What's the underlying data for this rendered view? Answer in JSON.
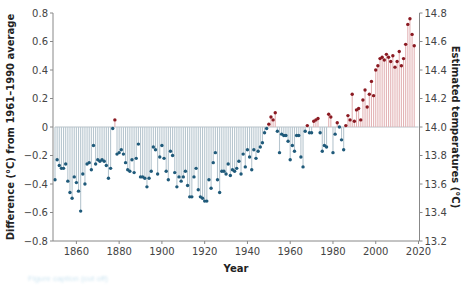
{
  "chart_data": {
    "type": "bar",
    "subtype": "lollipop",
    "title": "",
    "xlabel": "Year",
    "ylabel": "Difference (°C) from 1961–1990 average",
    "ylabel_right": "Estimated temperatures (°C)",
    "xlim": [
      1850,
      2020
    ],
    "ylim": [
      -0.8,
      0.8
    ],
    "ylim_right": [
      13.2,
      14.8
    ],
    "x_ticks": [
      1860,
      1880,
      1900,
      1920,
      1940,
      1960,
      1980,
      2000,
      2020
    ],
    "y_ticks": [
      -0.8,
      -0.6,
      -0.4,
      -0.2,
      0,
      0.2,
      0.4,
      0.6,
      0.8
    ],
    "y_ticks_right": [
      13.2,
      13.4,
      13.6,
      13.8,
      14.0,
      14.2,
      14.4,
      14.6,
      14.8
    ],
    "y_tick_labels": [
      "−0.8",
      "−0.6",
      "−0.4",
      "−0.2",
      "0",
      "0.2",
      "0.4",
      "0.6",
      "0.8"
    ],
    "y_tick_labels_right": [
      "13.2",
      "13.4",
      "13.6",
      "13.8",
      "14.0",
      "14.2",
      "14.4",
      "14.6",
      "14.8"
    ],
    "grid": false,
    "legend": null,
    "colors": {
      "negative_point": "#1f5a7a",
      "negative_bar": "#b7c6cf",
      "positive_point": "#8b1a22",
      "positive_bar": "#e3b4b6",
      "axis": "#888888"
    },
    "x_start": 1850,
    "values": [
      -0.37,
      -0.23,
      -0.27,
      -0.29,
      -0.29,
      -0.26,
      -0.38,
      -0.46,
      -0.5,
      -0.35,
      -0.39,
      -0.45,
      -0.59,
      -0.33,
      -0.4,
      -0.26,
      -0.25,
      -0.3,
      -0.13,
      -0.26,
      -0.23,
      -0.24,
      -0.23,
      -0.24,
      -0.27,
      -0.36,
      -0.29,
      -0.01,
      0.05,
      -0.19,
      -0.18,
      -0.16,
      -0.19,
      -0.25,
      -0.3,
      -0.31,
      -0.23,
      -0.32,
      -0.22,
      -0.12,
      -0.35,
      -0.35,
      -0.36,
      -0.42,
      -0.36,
      -0.31,
      -0.14,
      -0.16,
      -0.33,
      -0.21,
      -0.13,
      -0.22,
      -0.31,
      -0.37,
      -0.17,
      -0.2,
      -0.32,
      -0.42,
      -0.35,
      -0.38,
      -0.35,
      -0.31,
      -0.41,
      -0.49,
      -0.49,
      -0.35,
      -0.29,
      -0.44,
      -0.49,
      -0.5,
      -0.52,
      -0.52,
      -0.37,
      -0.43,
      -0.25,
      -0.18,
      -0.37,
      -0.46,
      -0.31,
      -0.31,
      -0.33,
      -0.26,
      -0.34,
      -0.3,
      -0.31,
      -0.29,
      -0.24,
      -0.33,
      -0.19,
      -0.28,
      -0.16,
      -0.21,
      -0.3,
      -0.16,
      -0.22,
      -0.17,
      -0.14,
      -0.11,
      -0.04,
      -0.01,
      0.02,
      0.07,
      0.05,
      0.1,
      -0.03,
      -0.18,
      -0.05,
      -0.06,
      -0.06,
      -0.1,
      -0.23,
      -0.13,
      -0.17,
      -0.06,
      -0.06,
      -0.21,
      -0.28,
      -0.03,
      0.01,
      -0.04,
      -0.04,
      0.04,
      0.05,
      0.06,
      -0.04,
      -0.17,
      -0.13,
      -0.14,
      0.09,
      0.07,
      -0.18,
      -0.05,
      0.03,
      0.0,
      -0.09,
      -0.16,
      0.01,
      0.08,
      0.05,
      0.23,
      0.04,
      0.12,
      0.13,
      0.05,
      0.19,
      0.26,
      0.14,
      0.23,
      0.32,
      0.22,
      0.4,
      0.43,
      0.48,
      0.49,
      0.47,
      0.51,
      0.49,
      0.46,
      0.5,
      0.42,
      0.46,
      0.53,
      0.43,
      0.48,
      0.58,
      0.72,
      0.76,
      0.65,
      0.57
    ]
  },
  "caption": "Figure caption (cut off)"
}
